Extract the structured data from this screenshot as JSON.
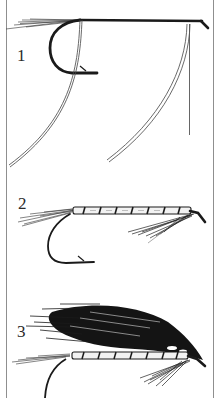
{
  "figure": {
    "type": "fly-tying step illustration",
    "colors": {
      "ink": "#1a1a1a",
      "border": "#9a9a9a",
      "paper": "#ffffff"
    },
    "stages": [
      {
        "label": "1",
        "description": "Bare hook with tail fibres and two loose tying strands (tinsel/floss) hanging from the shank"
      },
      {
        "label": "2",
        "description": "Hook with tail, ribbed tinsel body and throat hackle"
      },
      {
        "label": "3",
        "description": "Finished fly with dark hair wing over ribbed body, throat hackle and head"
      }
    ]
  }
}
